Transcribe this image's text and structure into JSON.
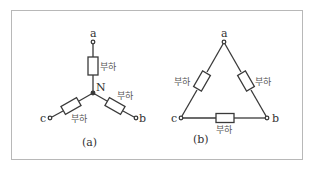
{
  "diagram": {
    "type": "circuit",
    "panels": [
      {
        "id": "a",
        "caption": "(a)",
        "topology": "wye",
        "center_node": "N",
        "terminals": [
          "a",
          "b",
          "c"
        ],
        "loads": [
          {
            "label": "부하",
            "between": [
              "a",
              "N"
            ]
          },
          {
            "label": "부하",
            "between": [
              "N",
              "b"
            ]
          },
          {
            "label": "부하",
            "between": [
              "N",
              "c"
            ]
          }
        ]
      },
      {
        "id": "b",
        "caption": "(b)",
        "topology": "delta",
        "terminals": [
          "a",
          "b",
          "c"
        ],
        "loads": [
          {
            "label": "부하",
            "between": [
              "a",
              "c"
            ]
          },
          {
            "label": "부하",
            "between": [
              "a",
              "b"
            ]
          },
          {
            "label": "부하",
            "between": [
              "c",
              "b"
            ]
          }
        ]
      }
    ]
  },
  "labels": {
    "a_term": "a",
    "b_term": "b",
    "c_term": "c",
    "n_node": "N",
    "load": "부하",
    "cap_a": "(a)",
    "cap_b": "(b)"
  },
  "colors": {
    "line": "#3a3a3a",
    "frame": "#b8b8b8",
    "text": "#333333"
  }
}
